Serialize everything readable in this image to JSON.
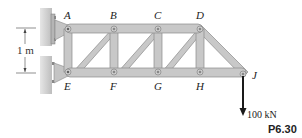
{
  "figure": {
    "problem_number": "P6.30",
    "dimension_label": "1 m",
    "load_label": "100 kN",
    "joints": {
      "A": "A",
      "B": "B",
      "C": "C",
      "D": "D",
      "E": "E",
      "F": "F",
      "G": "G",
      "H": "H",
      "J": "J"
    },
    "colors": {
      "member_fill": "#c8c8c8",
      "member_edge": "#8a8a8a",
      "wall": "#d4d4d4",
      "arrow": "#1a1a1a"
    }
  }
}
